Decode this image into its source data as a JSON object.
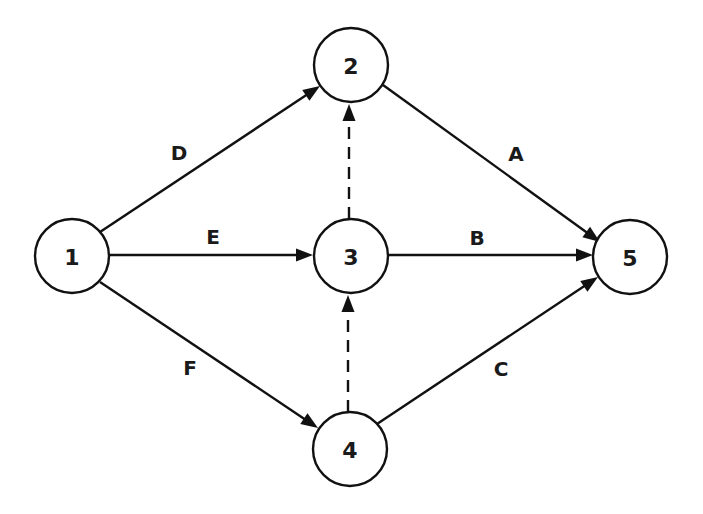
{
  "diagram": {
    "type": "activity-on-arrow network",
    "colors": {
      "stroke": "#111111",
      "text": "#1a1a1a",
      "background": "#ffffff"
    },
    "nodes": [
      {
        "id": "1",
        "label": "1",
        "cx": 72,
        "cy": 256,
        "r": 37
      },
      {
        "id": "2",
        "label": "2",
        "cx": 351,
        "cy": 65,
        "r": 37
      },
      {
        "id": "3",
        "label": "3",
        "cx": 351,
        "cy": 256,
        "r": 37
      },
      {
        "id": "4",
        "label": "4",
        "cx": 350,
        "cy": 449,
        "r": 37
      },
      {
        "id": "5",
        "label": "5",
        "cx": 630,
        "cy": 257,
        "r": 37
      }
    ],
    "edges": [
      {
        "from": "1",
        "to": "2",
        "label": "D",
        "dashed": false,
        "x1": 100,
        "y1": 232,
        "x2": 320,
        "y2": 86,
        "lx": 179,
        "ly": 153
      },
      {
        "from": "1",
        "to": "3",
        "label": "E",
        "dashed": false,
        "x1": 109,
        "y1": 255,
        "x2": 313,
        "y2": 255,
        "lx": 213,
        "ly": 237
      },
      {
        "from": "1",
        "to": "4",
        "label": "F",
        "dashed": false,
        "x1": 100,
        "y1": 282,
        "x2": 318,
        "y2": 428,
        "lx": 190,
        "ly": 368
      },
      {
        "from": "2",
        "to": "5",
        "label": "A",
        "dashed": false,
        "x1": 383,
        "y1": 85,
        "x2": 600,
        "y2": 242,
        "lx": 516,
        "ly": 154
      },
      {
        "from": "3",
        "to": "5",
        "label": "B",
        "dashed": false,
        "x1": 388,
        "y1": 255,
        "x2": 593,
        "y2": 255,
        "lx": 477,
        "ly": 238
      },
      {
        "from": "4",
        "to": "5",
        "label": "C",
        "dashed": false,
        "x1": 377,
        "y1": 424,
        "x2": 598,
        "y2": 277,
        "lx": 501,
        "ly": 369
      },
      {
        "from": "3",
        "to": "2",
        "label": "",
        "dashed": true,
        "x1": 349,
        "y1": 219,
        "x2": 349,
        "y2": 104
      },
      {
        "from": "4",
        "to": "3",
        "label": "",
        "dashed": true,
        "x1": 348,
        "y1": 412,
        "x2": 348,
        "y2": 295
      }
    ]
  }
}
